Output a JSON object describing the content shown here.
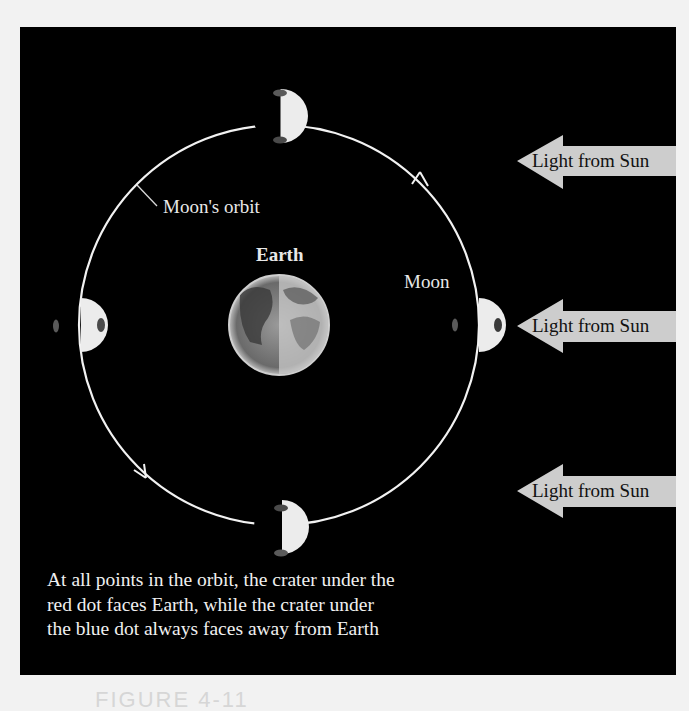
{
  "diagram": {
    "labels": {
      "orbit": "Moon's orbit",
      "earth": "Earth",
      "moon": "Moon"
    },
    "sun_arrows": [
      {
        "label": "Light from Sun"
      },
      {
        "label": "Light from Sun"
      },
      {
        "label": "Light from Sun"
      }
    ],
    "caption": [
      "At all points in the orbit, the crater under the",
      "red dot faces Earth, while the crater under",
      "the blue dot always faces away from Earth"
    ],
    "figure_label": "FIGURE 4-11",
    "colors": {
      "background": "#000000",
      "orbit": "#f2f2f2",
      "moon_lit": "#ececec",
      "arrow_fill": "#cdcdcd",
      "dot": "#5a5a5a"
    }
  }
}
